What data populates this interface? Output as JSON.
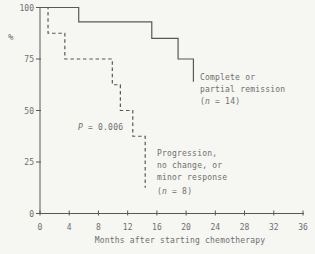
{
  "chart_data": {
    "type": "line",
    "subtype": "kaplan-meier-step",
    "title": "",
    "xlabel": "Months after starting chemotherapy",
    "ylabel": "%",
    "xlim": [
      0,
      36
    ],
    "ylim": [
      0,
      100
    ],
    "x_ticks": [
      0,
      4,
      8,
      12,
      16,
      20,
      24,
      28,
      32,
      36
    ],
    "y_ticks": [
      0,
      25,
      50,
      75,
      100
    ],
    "grid": false,
    "legend_position": "inline-annotations",
    "series": [
      {
        "name": "Complete or partial remission (n = 14)",
        "line_style": "solid",
        "n": 14,
        "steps_note": "each point [month, percent-after-drop]; curve is flat between drops",
        "points": [
          [
            0,
            100
          ],
          [
            5.3,
            93
          ],
          [
            15.3,
            85
          ],
          [
            18.9,
            75
          ],
          [
            21,
            64
          ]
        ]
      },
      {
        "name": "Progression, no change, or minor response (n = 8)",
        "line_style": "dashed",
        "n": 8,
        "points": [
          [
            0,
            100
          ],
          [
            1.1,
            87.5
          ],
          [
            3.4,
            75
          ],
          [
            9.9,
            62.5
          ],
          [
            11,
            50
          ],
          [
            12.7,
            37.5
          ],
          [
            14.4,
            12.5
          ]
        ]
      }
    ]
  },
  "labels": {
    "ylabel": "%",
    "xlabel": "Months after starting chemotherapy"
  },
  "annotations": {
    "p_value": {
      "p_char": "P",
      "rest": " = 0.006"
    },
    "legend_solid": {
      "line1": "Complete or",
      "line2": "partial remission",
      "n_pre": "(",
      "n_char": "n",
      "n_post": " = 14)"
    },
    "legend_dashed": {
      "line1": "Progression,",
      "line2": "no change, or",
      "line3": "minor response",
      "n_pre": "(",
      "n_char": "n",
      "n_post": " = 8)"
    }
  },
  "style": {
    "background": "#f6f6f3",
    "line_color": "#585858",
    "text_color": "#6e6e6e",
    "dash_pattern": "3.5 2.8"
  }
}
